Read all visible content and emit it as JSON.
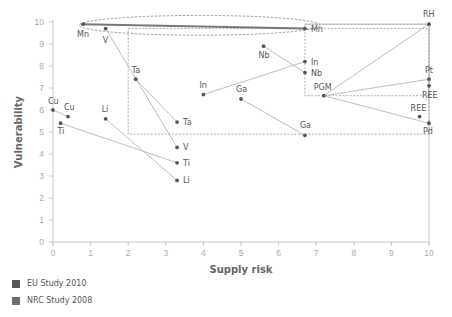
{
  "chart_data": {
    "type": "scatter",
    "title": "",
    "xlabel": "Supply risk",
    "ylabel": "Vulnerability",
    "xlim": [
      0,
      10
    ],
    "ylim": [
      0,
      10
    ],
    "x_ticks": [
      "0",
      "1",
      "2",
      "3",
      "4",
      "5",
      "6",
      "7",
      "8",
      "9",
      "10"
    ],
    "y_ticks": [
      "0",
      "1",
      "2",
      "3",
      "4",
      "5",
      "6",
      "7",
      "8",
      "9",
      "10"
    ],
    "grid": false,
    "legend_position": "bottom-left",
    "legend": [
      {
        "name": "EU Study 2010",
        "color": "#555555"
      },
      {
        "name": "NRC Study 2008",
        "color": "#6e6e6e"
      }
    ],
    "points": [
      {
        "label": "Mn",
        "x": 0.8,
        "y": 9.9,
        "lx": -6,
        "ly": 13
      },
      {
        "label": "Mn",
        "x": 6.7,
        "y": 9.7,
        "lx": 6,
        "ly": 3
      },
      {
        "label": "V",
        "x": 1.4,
        "y": 9.7,
        "lx": -3,
        "ly": 14
      },
      {
        "label": "V",
        "x": 3.3,
        "y": 4.3,
        "lx": 6,
        "ly": 3
      },
      {
        "label": "Ta",
        "x": 2.2,
        "y": 7.4,
        "lx": -4,
        "ly": -6
      },
      {
        "label": "Ta",
        "x": 3.3,
        "y": 5.45,
        "lx": 6,
        "ly": 3
      },
      {
        "label": "Cu",
        "x": 0.0,
        "y": 6.0,
        "lx": -5,
        "ly": -6
      },
      {
        "label": "Cu",
        "x": 0.4,
        "y": 5.7,
        "lx": -4,
        "ly": -7
      },
      {
        "label": "Ti",
        "x": 0.2,
        "y": 5.4,
        "lx": -3,
        "ly": 11
      },
      {
        "label": "Ti",
        "x": 3.3,
        "y": 3.6,
        "lx": 6,
        "ly": 3
      },
      {
        "label": "Li",
        "x": 1.4,
        "y": 5.6,
        "lx": -4,
        "ly": -7
      },
      {
        "label": "Li",
        "x": 3.3,
        "y": 2.8,
        "lx": 6,
        "ly": 3
      },
      {
        "label": "In",
        "x": 4.0,
        "y": 6.7,
        "lx": -4,
        "ly": -7
      },
      {
        "label": "In",
        "x": 6.7,
        "y": 8.2,
        "lx": 6,
        "ly": 3
      },
      {
        "label": "Nb",
        "x": 5.6,
        "y": 8.9,
        "lx": -5,
        "ly": 12
      },
      {
        "label": "Nb",
        "x": 6.7,
        "y": 7.7,
        "lx": 6,
        "ly": 3
      },
      {
        "label": "Ga",
        "x": 5.0,
        "y": 6.5,
        "lx": -5,
        "ly": -7
      },
      {
        "label": "Ga",
        "x": 6.7,
        "y": 4.85,
        "lx": -5,
        "ly": -7
      },
      {
        "label": "RH",
        "x": 10.0,
        "y": 9.9,
        "lx": -6,
        "ly": -7
      },
      {
        "label": "PGM",
        "x": 7.2,
        "y": 6.65,
        "lx": -10,
        "ly": -6
      },
      {
        "label": "Pt",
        "x": 10.0,
        "y": 7.4,
        "lx": -4,
        "ly": -6
      },
      {
        "label": "REE",
        "x": 10.0,
        "y": 7.1,
        "lx": -7,
        "ly": 12
      },
      {
        "label": "REE",
        "x": 9.75,
        "y": 5.7,
        "lx": -9,
        "ly": -6
      },
      {
        "label": "Pd",
        "x": 10.0,
        "y": 5.4,
        "lx": -6,
        "ly": 11
      }
    ],
    "connections": [
      {
        "from": "Mn",
        "from_xy": [
          0.8,
          9.9
        ],
        "to_xy": [
          6.7,
          9.7
        ],
        "emphasis": true
      },
      {
        "from": "V",
        "from_xy": [
          1.4,
          9.7
        ],
        "to_xy": [
          3.3,
          4.3
        ]
      },
      {
        "from": "Ta",
        "from_xy": [
          2.2,
          7.4
        ],
        "to_xy": [
          3.3,
          5.45
        ]
      },
      {
        "from": "Cu",
        "from_xy": [
          0.0,
          6.0
        ],
        "to_xy": [
          0.4,
          5.7
        ]
      },
      {
        "from": "Ti",
        "from_xy": [
          0.2,
          5.4
        ],
        "to_xy": [
          3.3,
          3.6
        ]
      },
      {
        "from": "Li",
        "from_xy": [
          1.4,
          5.6
        ],
        "to_xy": [
          3.3,
          2.8
        ]
      },
      {
        "from": "In",
        "from_xy": [
          4.0,
          6.7
        ],
        "to_xy": [
          6.7,
          8.2
        ]
      },
      {
        "from": "Nb",
        "from_xy": [
          5.6,
          8.9
        ],
        "to_xy": [
          6.7,
          7.7
        ]
      },
      {
        "from": "Ga",
        "from_xy": [
          5.0,
          6.5
        ],
        "to_xy": [
          6.7,
          4.85
        ]
      },
      {
        "from": "PGM-RH",
        "from_xy": [
          7.2,
          6.65
        ],
        "to_xy": [
          10.0,
          9.9
        ]
      },
      {
        "from": "PGM-Pt",
        "from_xy": [
          7.2,
          6.65
        ],
        "to_xy": [
          10.0,
          7.4
        ]
      },
      {
        "from": "PGM-Pd",
        "from_xy": [
          7.2,
          6.65
        ],
        "to_xy": [
          10.0,
          5.4
        ]
      },
      {
        "from": "RH-Mn top",
        "from_xy": [
          6.7,
          9.9
        ],
        "to_xy": [
          10.0,
          9.9
        ]
      }
    ],
    "annotations": {
      "dashed_regions": [
        {
          "type": "rect",
          "x": [
            2.0,
            10.0
          ],
          "y": [
            4.9,
            9.7
          ],
          "note": "dashed box EU critical region"
        },
        {
          "type": "rect",
          "x": [
            6.7,
            10.0
          ],
          "y": [
            6.65,
            9.9
          ],
          "note": "dashed inner box"
        }
      ],
      "dashed_ellipse": {
        "cx": 3.9,
        "cy": 9.85,
        "rx": 3.2,
        "ry": 0.45
      }
    }
  }
}
